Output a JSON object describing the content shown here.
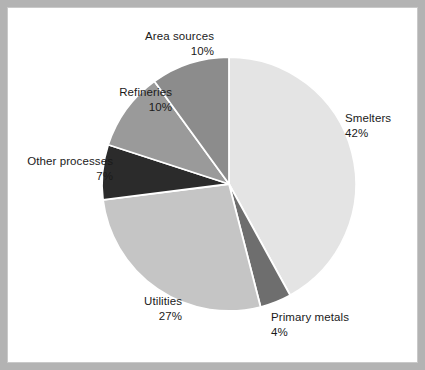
{
  "figure": {
    "background_color": "#ffffff",
    "border_color": "#b3b3b3",
    "inner_border_color": "#c9c9c9"
  },
  "chart_data": {
    "type": "pie",
    "title": "",
    "subtitle": "",
    "xlabel": "",
    "ylabel": "",
    "grid": false,
    "legend_position": "outside-labels",
    "start_angle_deg": 0,
    "direction": "clockwise",
    "units": "percent",
    "total": 100,
    "categories": [
      "Smelters",
      "Primary metals",
      "Utilities",
      "Other processes",
      "Refineries",
      "Area sources"
    ],
    "values": [
      42,
      4,
      27,
      7,
      10,
      10
    ],
    "slices": [
      {
        "label": "Smelters",
        "value": 42,
        "value_text": "42%",
        "color": "#e4e4e4",
        "label_align": "left"
      },
      {
        "label": "Primary metals",
        "value": 4,
        "value_text": "4%",
        "color": "#6e6e6e",
        "label_align": "left"
      },
      {
        "label": "Utilities",
        "value": 27,
        "value_text": "27%",
        "color": "#c5c5c5",
        "label_align": "right"
      },
      {
        "label": "Other processes",
        "value": 7,
        "value_text": "7%",
        "color": "#2b2b2b",
        "label_align": "right"
      },
      {
        "label": "Refineries",
        "value": 10,
        "value_text": "10%",
        "color": "#9a9a9a",
        "label_align": "right"
      },
      {
        "label": "Area sources",
        "value": 10,
        "value_text": "10%",
        "color": "#8c8c8c",
        "label_align": "right"
      }
    ],
    "slice_separator_color": "#ffffff",
    "center": {
      "x": 229,
      "y": 184
    },
    "radius": 127
  }
}
